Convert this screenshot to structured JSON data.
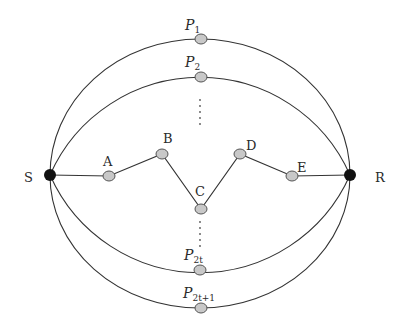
{
  "diagram": {
    "type": "multipath-network",
    "endpoints": {
      "source": {
        "label": "S",
        "x": 50,
        "y": 175
      },
      "receiver": {
        "label": "R",
        "x": 350,
        "y": 175
      }
    },
    "paths": [
      {
        "id": "P1",
        "label_main": "P",
        "label_sub": "1",
        "node": {
          "x": 201,
          "y": 39
        }
      },
      {
        "id": "P2",
        "label_main": "P",
        "label_sub": "2",
        "node": {
          "x": 201,
          "y": 77
        }
      },
      {
        "id": "P2t",
        "label_main": "P",
        "label_sub": "2t",
        "node": {
          "x": 200,
          "y": 270
        }
      },
      {
        "id": "P2t+1",
        "label_main": "P",
        "label_sub": "2t+1",
        "node": {
          "x": 201,
          "y": 308
        }
      }
    ],
    "middle_path": {
      "nodes": [
        {
          "label": "A",
          "x": 109,
          "y": 176
        },
        {
          "label": "B",
          "x": 162,
          "y": 154
        },
        {
          "label": "C",
          "x": 201,
          "y": 209
        },
        {
          "label": "D",
          "x": 240,
          "y": 154
        },
        {
          "label": "E",
          "x": 292,
          "y": 176
        }
      ]
    },
    "ellipsis": "⋮",
    "colors": {
      "edge": "#333333",
      "endpoint_fill": "#111111",
      "relay_fill": "#c8c8c8",
      "relay_stroke": "#555555",
      "background": "#ffffff"
    }
  }
}
